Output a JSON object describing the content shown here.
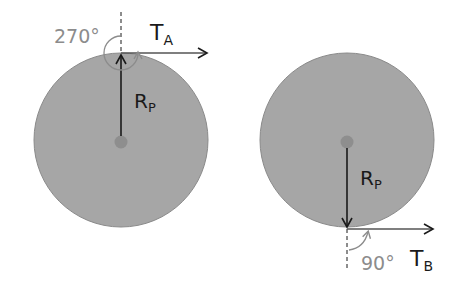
{
  "diagram": {
    "colors": {
      "disk_fill": "#a6a6a6",
      "disk_stroke": "#8a8a8a",
      "center_dot": "#8e8e8e",
      "ink": "#1a1a1a",
      "angle_ink": "#8c8c8c",
      "background": "#ffffff"
    },
    "left": {
      "tension_label": "T",
      "tension_subscript": "A",
      "radius_label": "R",
      "radius_subscript": "P",
      "angle_label": "270°"
    },
    "right": {
      "tension_label": "T",
      "tension_subscript": "B",
      "radius_label": "R",
      "radius_subscript": "P",
      "angle_label": "90°"
    }
  }
}
